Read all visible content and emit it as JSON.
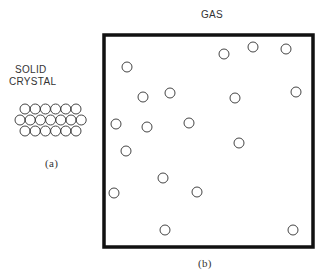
{
  "labels": {
    "solid_title_line1": "SOLID",
    "solid_title_line2": "CRYSTAL",
    "solid_caption": "(a)",
    "gas_title": "GAS",
    "gas_caption": "(b)"
  },
  "crystal": {
    "rows": [
      6,
      7,
      6
    ],
    "circle_radius": 5
  },
  "gas": {
    "box": {
      "x": 104,
      "y": 35,
      "width": 209,
      "height": 212
    },
    "circle_radius": 5,
    "particles": [
      [
        127,
        67
      ],
      [
        224,
        54
      ],
      [
        253,
        47
      ],
      [
        286,
        49
      ],
      [
        143,
        97
      ],
      [
        170,
        93
      ],
      [
        235,
        98
      ],
      [
        296,
        92
      ],
      [
        116,
        124
      ],
      [
        147,
        127
      ],
      [
        189,
        123
      ],
      [
        239,
        143
      ],
      [
        126,
        151
      ],
      [
        163,
        178
      ],
      [
        114,
        193
      ],
      [
        197,
        192
      ],
      [
        165,
        230
      ],
      [
        293,
        230
      ]
    ]
  },
  "colors": {
    "stroke": "#444444",
    "box": "#111111"
  }
}
